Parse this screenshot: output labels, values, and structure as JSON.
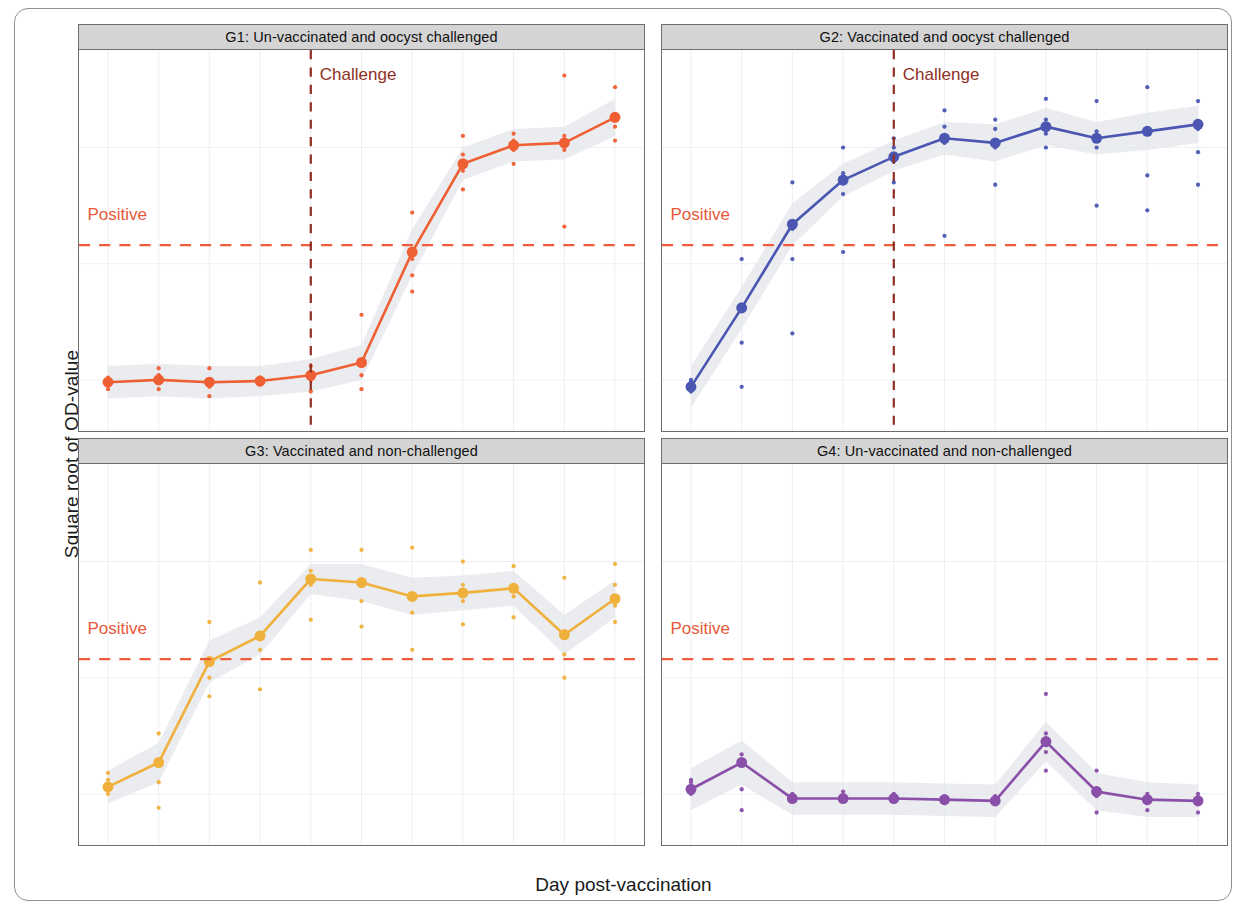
{
  "figure": {
    "ylabel": "Square root of OD-value",
    "xlabel": "Day post-vaccination",
    "positive_label": "Positive",
    "challenge_label": "Challenge"
  },
  "chart_data": {
    "type": "line",
    "title": "",
    "xlabel": "Day post-vaccination",
    "ylabel": "Square root of OD-value",
    "x": [
      0,
      7,
      14,
      21,
      28,
      35,
      42,
      49,
      56,
      63,
      70
    ],
    "xlim": [
      -4,
      74
    ],
    "ylim": [
      -0.22,
      1.42
    ],
    "yticks": [
      0.0,
      0.5,
      1.0
    ],
    "ytick_labels": [
      "0.0",
      "0.5",
      "1.0"
    ],
    "xticks": [
      0,
      7,
      14,
      21,
      28,
      35,
      42,
      49,
      56,
      63,
      70
    ],
    "xtick_labels": [
      "0",
      "7",
      "14",
      "21",
      "28",
      "35",
      "42",
      "49",
      "56",
      "63",
      "70"
    ],
    "grid": true,
    "legend": "none",
    "annotations": [
      {
        "name": "positive-threshold",
        "type": "hline",
        "label": "Positive",
        "value": 0.58,
        "color": "#ef5b3c",
        "style": "dashed",
        "panels": [
          "G1",
          "G2",
          "G3",
          "G4"
        ]
      },
      {
        "name": "challenge-line",
        "type": "vline",
        "label": "Challenge",
        "value": 28,
        "color": "#8f2f24",
        "style": "dashed",
        "panels": [
          "G1",
          "G2"
        ]
      }
    ],
    "panels": [
      {
        "id": "G1",
        "title": "G1: Un-vaccinated and oocyst challenged",
        "color": "#ef5f34",
        "band_color": "#e3e5ea",
        "values": [
          -0.01,
          0.0,
          -0.01,
          -0.005,
          0.02,
          0.075,
          0.55,
          0.93,
          1.01,
          1.02,
          1.13
        ],
        "ci_low": [
          -0.08,
          -0.07,
          -0.08,
          -0.07,
          -0.05,
          0.0,
          0.45,
          0.86,
          0.94,
          0.95,
          1.05
        ],
        "ci_high": [
          0.06,
          0.07,
          0.06,
          0.06,
          0.09,
          0.15,
          0.65,
          1.0,
          1.08,
          1.09,
          1.21
        ],
        "points": [
          {
            "x": 0,
            "ys": [
              -0.04,
              -0.01,
              0.0,
              0.01
            ]
          },
          {
            "x": 7,
            "ys": [
              -0.04,
              -0.01,
              0.02,
              0.05
            ]
          },
          {
            "x": 14,
            "ys": [
              -0.07,
              -0.03,
              -0.01,
              0.05
            ]
          },
          {
            "x": 21,
            "ys": [
              -0.02,
              -0.01,
              0.0,
              0.01
            ]
          },
          {
            "x": 28,
            "ys": [
              -0.05,
              0.0,
              0.03,
              0.06
            ]
          },
          {
            "x": 35,
            "ys": [
              -0.04,
              0.02,
              0.08,
              0.28
            ]
          },
          {
            "x": 42,
            "ys": [
              0.38,
              0.45,
              0.52,
              0.72
            ]
          },
          {
            "x": 49,
            "ys": [
              0.82,
              0.9,
              0.97,
              1.05
            ]
          },
          {
            "x": 56,
            "ys": [
              0.93,
              0.99,
              1.03,
              1.06
            ]
          },
          {
            "x": 63,
            "ys": [
              0.66,
              0.99,
              1.05,
              1.31
            ]
          },
          {
            "x": 70,
            "ys": [
              1.03,
              1.09,
              1.14,
              1.26
            ]
          }
        ]
      },
      {
        "id": "G2",
        "title": "G2: Vaccinated and oocyst challenged",
        "color": "#4a56b2",
        "band_color": "#e3e5ea",
        "values": [
          -0.03,
          0.31,
          0.67,
          0.86,
          0.96,
          1.04,
          1.02,
          1.09,
          1.04,
          1.07,
          1.1
        ],
        "ci_low": [
          -0.12,
          0.22,
          0.58,
          0.79,
          0.9,
          0.97,
          0.94,
          1.01,
          0.97,
          0.99,
          1.02
        ],
        "ci_high": [
          0.06,
          0.4,
          0.76,
          0.93,
          1.03,
          1.11,
          1.1,
          1.17,
          1.11,
          1.15,
          1.18
        ],
        "points": [
          {
            "x": 0,
            "ys": [
              -0.05,
              -0.03,
              -0.01,
              0.0
            ]
          },
          {
            "x": 7,
            "ys": [
              -0.03,
              0.16,
              0.3,
              0.52
            ]
          },
          {
            "x": 14,
            "ys": [
              0.2,
              0.52,
              0.65,
              0.85
            ]
          },
          {
            "x": 21,
            "ys": [
              0.55,
              0.8,
              0.89,
              1.0
            ]
          },
          {
            "x": 28,
            "ys": [
              0.85,
              0.94,
              1.0,
              1.04
            ]
          },
          {
            "x": 35,
            "ys": [
              0.62,
              1.02,
              1.09,
              1.16
            ]
          },
          {
            "x": 42,
            "ys": [
              0.84,
              1.0,
              1.08,
              1.12
            ]
          },
          {
            "x": 49,
            "ys": [
              1.0,
              1.06,
              1.12,
              1.21
            ]
          },
          {
            "x": 56,
            "ys": [
              0.75,
              1.0,
              1.07,
              1.2
            ]
          },
          {
            "x": 63,
            "ys": [
              0.73,
              0.88,
              1.06,
              1.26
            ]
          },
          {
            "x": 70,
            "ys": [
              0.84,
              0.98,
              1.08,
              1.2
            ]
          }
        ]
      },
      {
        "id": "G3",
        "title": "G3: Vaccinated and non-challenged",
        "color": "#f0b03c",
        "band_color": "#e3e5ea",
        "values": [
          0.03,
          0.135,
          0.57,
          0.68,
          0.925,
          0.91,
          0.85,
          0.865,
          0.885,
          0.685,
          0.84
        ],
        "ci_low": [
          -0.04,
          0.05,
          0.48,
          0.6,
          0.86,
          0.83,
          0.77,
          0.79,
          0.81,
          0.6,
          0.76
        ],
        "ci_high": [
          0.1,
          0.22,
          0.66,
          0.76,
          0.99,
          0.99,
          0.93,
          0.94,
          0.96,
          0.77,
          0.92
        ],
        "points": [
          {
            "x": 0,
            "ys": [
              0.0,
              0.03,
              0.06,
              0.09
            ]
          },
          {
            "x": 7,
            "ys": [
              -0.06,
              0.05,
              0.14,
              0.26
            ]
          },
          {
            "x": 14,
            "ys": [
              0.42,
              0.5,
              0.57,
              0.74
            ]
          },
          {
            "x": 21,
            "ys": [
              0.45,
              0.62,
              0.69,
              0.91
            ]
          },
          {
            "x": 28,
            "ys": [
              0.75,
              0.9,
              0.96,
              1.05
            ]
          },
          {
            "x": 35,
            "ys": [
              0.72,
              0.83,
              0.91,
              1.05
            ]
          },
          {
            "x": 42,
            "ys": [
              0.62,
              0.78,
              0.86,
              1.06
            ]
          },
          {
            "x": 49,
            "ys": [
              0.73,
              0.83,
              0.9,
              1.0
            ]
          },
          {
            "x": 56,
            "ys": [
              0.76,
              0.85,
              0.9,
              0.98
            ]
          },
          {
            "x": 63,
            "ys": [
              0.5,
              0.6,
              0.7,
              0.93
            ]
          },
          {
            "x": 70,
            "ys": [
              0.74,
              0.81,
              0.9,
              0.99
            ]
          }
        ]
      },
      {
        "id": "G4",
        "title": "G4: Un-vaccinated and non-challenged",
        "color": "#8a4fa8",
        "band_color": "#e3e5ea",
        "values": [
          0.02,
          0.135,
          -0.02,
          -0.02,
          -0.02,
          -0.025,
          -0.03,
          0.225,
          0.01,
          -0.025,
          -0.03
        ],
        "ci_low": [
          -0.07,
          0.04,
          -0.09,
          -0.09,
          -0.09,
          -0.095,
          -0.1,
          0.14,
          -0.07,
          -0.1,
          -0.1
        ],
        "ci_high": [
          0.11,
          0.23,
          0.05,
          0.05,
          0.05,
          0.045,
          0.04,
          0.31,
          0.09,
          0.05,
          0.04
        ],
        "points": [
          {
            "x": 0,
            "ys": [
              0.0,
              0.02,
              0.05,
              0.06
            ]
          },
          {
            "x": 7,
            "ys": [
              -0.07,
              0.02,
              0.13,
              0.17
            ]
          },
          {
            "x": 14,
            "ys": [
              -0.03,
              -0.02,
              -0.01,
              0.0
            ]
          },
          {
            "x": 21,
            "ys": [
              -0.03,
              -0.02,
              -0.01,
              0.01
            ]
          },
          {
            "x": 28,
            "ys": [
              -0.03,
              -0.02,
              -0.01,
              0.0
            ]
          },
          {
            "x": 35,
            "ys": [
              -0.04,
              -0.03,
              -0.02,
              -0.01
            ]
          },
          {
            "x": 42,
            "ys": [
              -0.04,
              -0.03,
              -0.02,
              -0.01
            ]
          },
          {
            "x": 49,
            "ys": [
              0.1,
              0.18,
              0.26,
              0.43
            ]
          },
          {
            "x": 56,
            "ys": [
              -0.08,
              -0.01,
              0.02,
              0.1
            ]
          },
          {
            "x": 63,
            "ys": [
              -0.07,
              -0.04,
              -0.02,
              0.0
            ]
          },
          {
            "x": 70,
            "ys": [
              -0.08,
              -0.04,
              -0.02,
              0.0
            ]
          }
        ]
      }
    ]
  }
}
